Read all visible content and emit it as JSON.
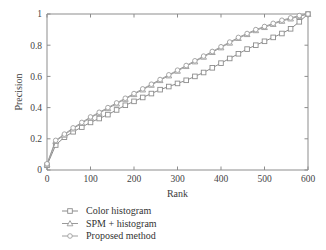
{
  "chart_data": {
    "type": "line",
    "title": "",
    "xlabel": "Rank",
    "ylabel": "Precision",
    "xlim": [
      0,
      600
    ],
    "ylim": [
      0,
      1
    ],
    "xticks": [
      0,
      100,
      200,
      300,
      400,
      500,
      600
    ],
    "xtick_labels": [
      "0",
      "100",
      "200",
      "300",
      "400",
      "500",
      "600"
    ],
    "yticks": [
      0,
      0.2,
      0.4,
      0.6,
      0.8,
      1
    ],
    "ytick_labels": [
      "0",
      "0.2",
      "0.4",
      "0.6",
      "0.8",
      "1"
    ],
    "grid": false,
    "legend_position": "below-plot-left",
    "x": [
      0,
      20,
      40,
      60,
      80,
      100,
      120,
      140,
      160,
      180,
      200,
      220,
      240,
      260,
      280,
      300,
      320,
      340,
      360,
      380,
      400,
      420,
      440,
      460,
      480,
      500,
      520,
      540,
      560,
      580,
      600
    ],
    "series": [
      {
        "name": "Color histogram",
        "marker": "square",
        "color": "#8c8c8c",
        "values": [
          0.03,
          0.16,
          0.21,
          0.245,
          0.275,
          0.305,
          0.33,
          0.355,
          0.385,
          0.415,
          0.44,
          0.465,
          0.49,
          0.515,
          0.535,
          0.555,
          0.575,
          0.6,
          0.625,
          0.655,
          0.685,
          0.715,
          0.745,
          0.775,
          0.8,
          0.825,
          0.85,
          0.875,
          0.905,
          0.95,
          1.0
        ]
      },
      {
        "name": "SPM + histogram",
        "marker": "triangle",
        "color": "#9a9a9a",
        "values": [
          0.035,
          0.185,
          0.225,
          0.265,
          0.3,
          0.335,
          0.365,
          0.395,
          0.425,
          0.455,
          0.485,
          0.515,
          0.545,
          0.575,
          0.605,
          0.635,
          0.665,
          0.695,
          0.725,
          0.755,
          0.785,
          0.815,
          0.845,
          0.87,
          0.895,
          0.915,
          0.935,
          0.955,
          0.97,
          0.985,
          1.0
        ]
      },
      {
        "name": "Proposed method",
        "marker": "circle",
        "color": "#9e9e9e",
        "values": [
          0.04,
          0.19,
          0.23,
          0.27,
          0.305,
          0.34,
          0.37,
          0.4,
          0.43,
          0.46,
          0.49,
          0.52,
          0.55,
          0.58,
          0.61,
          0.64,
          0.67,
          0.7,
          0.73,
          0.76,
          0.79,
          0.82,
          0.85,
          0.875,
          0.9,
          0.92,
          0.94,
          0.96,
          0.975,
          0.99,
          1.0
        ]
      }
    ]
  },
  "legend": {
    "items": [
      {
        "label": "Color histogram",
        "marker": "square-marker-icon"
      },
      {
        "label": "SPM + histogram",
        "marker": "triangle-marker-icon"
      },
      {
        "label": "Proposed method",
        "marker": "circle-marker-icon"
      }
    ]
  }
}
